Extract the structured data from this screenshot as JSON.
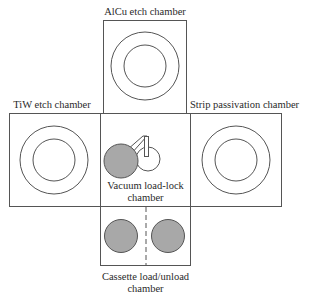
{
  "diagram": {
    "type": "cluster-tool-layout",
    "colors": {
      "line": "#555555",
      "wafer_fill": "#a8a8a8",
      "background": "#ffffff"
    },
    "chambers": {
      "top": {
        "label": "AlCu etch chamber"
      },
      "left": {
        "label": "TiW etch chamber"
      },
      "right": {
        "label": "Strip passivation chamber"
      },
      "center": {
        "label_line1": "Vacuum load-lock",
        "label_line2": "chamber"
      },
      "bottom": {
        "label_line1": "Cassette load/unload",
        "label_line2": "chamber"
      }
    }
  }
}
